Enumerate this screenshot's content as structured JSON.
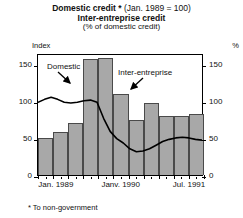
{
  "title": {
    "line1_bold": "Domestic credit *",
    "line1_normal": "(Jan. 1989 = 100)",
    "line2": "Inter-entreprise credit",
    "line3": "(% of domestic credit)"
  },
  "axes": {
    "left_unit": "Index",
    "right_unit": "%",
    "y_ticks": [
      0,
      50,
      100,
      150
    ],
    "x_labels": [
      {
        "text": "Jan. 1989",
        "pos": 0.02
      },
      {
        "text": "Janv. 1990",
        "pos": 0.4
      },
      {
        "text": "Jul. 1991",
        "pos": 0.83
      }
    ]
  },
  "annotations": {
    "domestic": "Domestic",
    "inter_entreprise": "Inter-entreprise"
  },
  "footnote": "* To non-government",
  "colors": {
    "bar_fill": "#a8a8a8",
    "bar_edge": "#4a4a4a",
    "line": "#000000",
    "frame": "#000000"
  },
  "chart_data": {
    "type": "bar",
    "xlabel": "",
    "ylabel": "Index",
    "ylabel_right": "%",
    "ylim": [
      0,
      165
    ],
    "y_ticks": [
      0,
      50,
      100,
      150
    ],
    "grid": false,
    "legend": "annotated-inline",
    "categories": [
      "Jan. 1989",
      "Apr. 1989",
      "Jul. 1989",
      "Oct. 1989",
      "Janv. 1990",
      "Apr. 1990",
      "Jul. 1990",
      "Oct. 1990",
      "Janv. 1991",
      "Apr. 1991",
      "Jul. 1991"
    ],
    "series": [
      {
        "name": "Inter-entreprise",
        "type": "bar",
        "unit": "% of domestic credit",
        "values": [
          50,
          58,
          70,
          157,
          158,
          110,
          75,
          97,
          80,
          80,
          82
        ]
      },
      {
        "name": "Domestic",
        "type": "line",
        "unit": "Index (Jan. 1989 = 100)",
        "x": [
          0.0,
          0.04,
          0.08,
          0.12,
          0.16,
          0.2,
          0.24,
          0.28,
          0.32,
          0.36,
          0.4,
          0.44,
          0.48,
          0.52,
          0.56,
          0.6,
          0.64,
          0.68,
          0.72,
          0.76,
          0.8,
          0.84,
          0.88,
          0.92,
          0.96,
          1.0
        ],
        "values": [
          100,
          104,
          107,
          104,
          100,
          99,
          100,
          102,
          103,
          100,
          78,
          60,
          50,
          44,
          36,
          32,
          33,
          36,
          41,
          46,
          49,
          51,
          52,
          51,
          49,
          48
        ]
      }
    ]
  }
}
